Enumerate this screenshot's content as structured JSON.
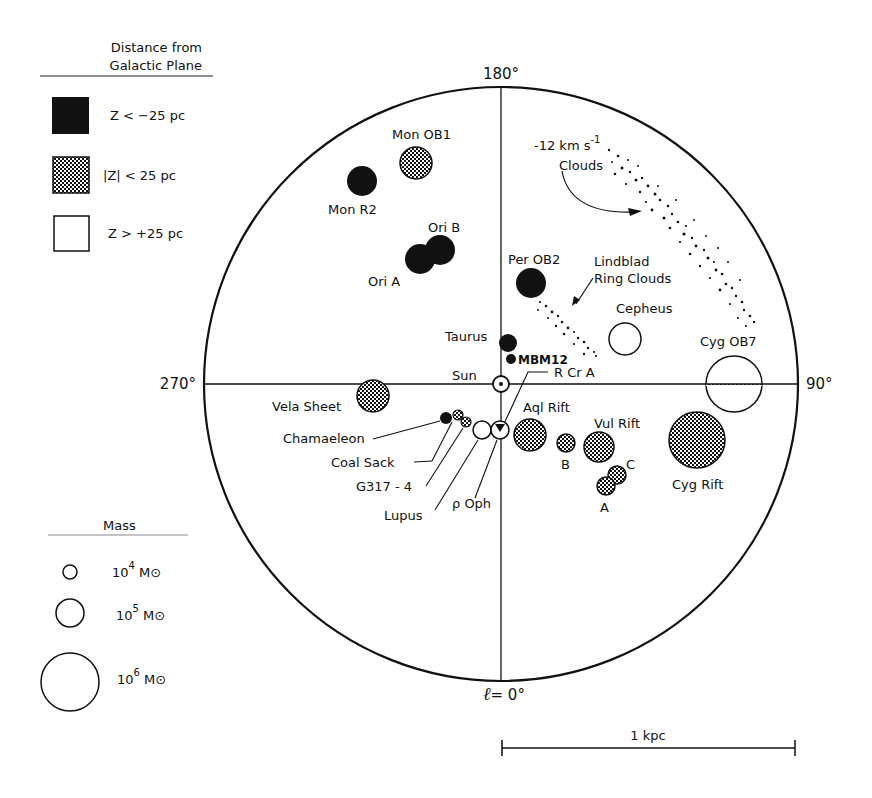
{
  "legend_distance": {
    "title_line1": "Distance from",
    "title_line2": "Galactic Plane",
    "items": [
      {
        "fill": "solid",
        "label": "Z < −25 pc"
      },
      {
        "fill": "hatched",
        "label": "|Z| < 25 pc"
      },
      {
        "fill": "open",
        "label": "Z > +25 pc"
      }
    ]
  },
  "legend_mass": {
    "title": "Mass",
    "items": [
      {
        "label_base": "10",
        "exp": "4",
        "unit": "M⊙"
      },
      {
        "label_base": "10",
        "exp": "5",
        "unit": "M⊙"
      },
      {
        "label_base": "10",
        "exp": "6",
        "unit": "M⊙"
      }
    ]
  },
  "axes": {
    "top": "180°",
    "left": "270°",
    "right": "90°",
    "bottom_l": "ℓ",
    "bottom_val": "= 0°"
  },
  "sun_label": "Sun",
  "clouds": [
    {
      "name": "Mon OB1",
      "fill": "hatched"
    },
    {
      "name": "Mon R2",
      "fill": "solid"
    },
    {
      "name": "Ori B",
      "fill": "solid"
    },
    {
      "name": "Ori A",
      "fill": "solid"
    },
    {
      "name": "Per OB2",
      "fill": "solid"
    },
    {
      "name": "Taurus",
      "fill": "solid"
    },
    {
      "name": "MBM12",
      "fill": "solid"
    },
    {
      "name": "R Cr A",
      "fill": "solid"
    },
    {
      "name": "Cepheus",
      "fill": "open"
    },
    {
      "name": "Cyg OB7",
      "fill": "open"
    },
    {
      "name": "Vela Sheet",
      "fill": "hatched"
    },
    {
      "name": "Chamaeleon",
      "fill": "solid"
    },
    {
      "name": "Coal Sack",
      "fill": "hatched"
    },
    {
      "name": "G317 - 4",
      "fill": "hatched"
    },
    {
      "name": "Lupus",
      "fill": "open"
    },
    {
      "name": "ρ Oph",
      "fill": "open"
    },
    {
      "name": "Aql Rift",
      "fill": "hatched"
    },
    {
      "name": "B",
      "fill": "hatched"
    },
    {
      "name": "Vul Rift",
      "fill": "hatched"
    },
    {
      "name": "C",
      "fill": "hatched"
    },
    {
      "name": "A",
      "fill": "hatched"
    },
    {
      "name": "Cyg Rift",
      "fill": "hatched"
    }
  ],
  "annotations": {
    "vel_clouds_line1": "-12 km s",
    "vel_clouds_exp": "-1",
    "vel_clouds_line2": "Clouds",
    "lindblad_line1": "Lindblad",
    "lindblad_line2": "Ring Clouds"
  },
  "scale_bar": {
    "label": "1 kpc"
  }
}
